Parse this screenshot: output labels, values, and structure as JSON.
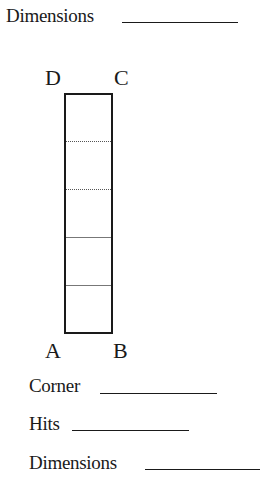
{
  "header": {
    "dimensions_label": "Dimensions"
  },
  "diagram": {
    "corners": {
      "top_left": "D",
      "top_right": "C",
      "bottom_left": "A",
      "bottom_right": "B"
    },
    "sections": 5
  },
  "fields": [
    {
      "label": "Corner",
      "value": ""
    },
    {
      "label": "Hits",
      "value": ""
    },
    {
      "label": "Dimensions",
      "value": ""
    }
  ]
}
